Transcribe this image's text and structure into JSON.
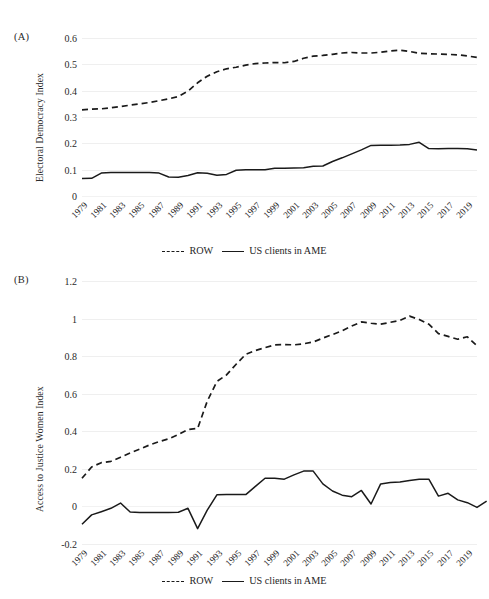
{
  "figure": {
    "panels": [
      {
        "id": "A",
        "label": "(A)",
        "ylabel": "Electoral Democracy Index"
      },
      {
        "id": "B",
        "label": "(B)",
        "ylabel": "Access to Justice Women Index"
      }
    ]
  },
  "legend": {
    "position": "bottom-center",
    "items": [
      {
        "label": "ROW",
        "style": "dashed"
      },
      {
        "label": "US clients in AME",
        "style": "solid"
      }
    ]
  },
  "chart_data": [
    {
      "type": "line",
      "panel": "A",
      "title": "",
      "xlabel": "",
      "ylabel": "Electoral Democracy Index",
      "ylim": [
        0,
        0.6
      ],
      "yticks": [
        0,
        0.1,
        0.2,
        0.3,
        0.4,
        0.5,
        0.6
      ],
      "ytick_labels": [
        "0",
        "0.1",
        "0.2",
        "0.3",
        "0.4",
        "0.5",
        "0.6"
      ],
      "grid": true,
      "x": [
        1979,
        1980,
        1981,
        1982,
        1983,
        1984,
        1985,
        1986,
        1987,
        1988,
        1989,
        1990,
        1991,
        1992,
        1993,
        1994,
        1995,
        1996,
        1997,
        1998,
        1999,
        2000,
        2001,
        2002,
        2003,
        2004,
        2005,
        2006,
        2007,
        2008,
        2009,
        2010,
        2011,
        2012,
        2013,
        2014,
        2015,
        2016,
        2017,
        2018,
        2019,
        2020
      ],
      "xtick_labels": [
        "1979",
        "1981",
        "1983",
        "1985",
        "1987",
        "1989",
        "1991",
        "1993",
        "1995",
        "1997",
        "1999",
        "2001",
        "2003",
        "2005",
        "2007",
        "2009",
        "2011",
        "2013",
        "2015",
        "2017",
        "2019"
      ],
      "series": [
        {
          "name": "ROW",
          "style": "dashed",
          "values": [
            0.327,
            0.33,
            0.331,
            0.335,
            0.34,
            0.345,
            0.35,
            0.355,
            0.362,
            0.369,
            0.378,
            0.398,
            0.43,
            0.455,
            0.472,
            0.483,
            0.489,
            0.497,
            0.503,
            0.505,
            0.507,
            0.506,
            0.511,
            0.523,
            0.531,
            0.534,
            0.538,
            0.543,
            0.545,
            0.543,
            0.543,
            0.546,
            0.551,
            0.554,
            0.549,
            0.542,
            0.54,
            0.539,
            0.538,
            0.536,
            0.532,
            0.526
          ]
        },
        {
          "name": "US clients in AME",
          "style": "solid",
          "values": [
            0.066,
            0.067,
            0.087,
            0.089,
            0.089,
            0.089,
            0.089,
            0.089,
            0.087,
            0.072,
            0.071,
            0.078,
            0.088,
            0.086,
            0.079,
            0.082,
            0.098,
            0.1,
            0.1,
            0.1,
            0.105,
            0.105,
            0.106,
            0.107,
            0.113,
            0.114,
            0.131,
            0.145,
            0.16,
            0.175,
            0.192,
            0.193,
            0.193,
            0.194,
            0.196,
            0.204,
            0.18,
            0.179,
            0.18,
            0.18,
            0.179,
            0.175
          ]
        }
      ]
    },
    {
      "type": "line",
      "panel": "B",
      "title": "",
      "xlabel": "",
      "ylabel": "Access to Justice Women Index",
      "ylim": [
        -0.2,
        1.2
      ],
      "yticks": [
        -0.2,
        0,
        0.2,
        0.4,
        0.6,
        0.8,
        1,
        1.2
      ],
      "ytick_labels": [
        "-0.2",
        "0",
        "0.2",
        "0.4",
        "0.6",
        "0.8",
        "1",
        "1.2"
      ],
      "grid": true,
      "x": [
        1979,
        1980,
        1981,
        1982,
        1983,
        1984,
        1985,
        1986,
        1987,
        1988,
        1989,
        1990,
        1991,
        1992,
        1993,
        1994,
        1995,
        1996,
        1997,
        1998,
        1999,
        2000,
        2001,
        2002,
        2003,
        2004,
        2005,
        2006,
        2007,
        2008,
        2009,
        2010,
        2011,
        2012,
        2013,
        2014,
        2015,
        2016,
        2017,
        2018,
        2019,
        2020
      ],
      "xtick_labels": [
        "1979",
        "1981",
        "1983",
        "1985",
        "1987",
        "1989",
        "1991",
        "1993",
        "1995",
        "1997",
        "1999",
        "2001",
        "2003",
        "2005",
        "2007",
        "2009",
        "2011",
        "2013",
        "2015",
        "2017",
        "2019"
      ],
      "series": [
        {
          "name": "ROW",
          "style": "dashed",
          "values": [
            0.15,
            0.21,
            0.233,
            0.24,
            0.262,
            0.285,
            0.305,
            0.327,
            0.345,
            0.36,
            0.383,
            0.41,
            0.415,
            0.56,
            0.665,
            0.7,
            0.757,
            0.81,
            0.83,
            0.845,
            0.86,
            0.862,
            0.86,
            0.866,
            0.875,
            0.896,
            0.915,
            0.935,
            0.96,
            0.982,
            0.975,
            0.97,
            0.98,
            0.99,
            1.013,
            0.995,
            0.97,
            0.92,
            0.905,
            0.89,
            0.903,
            0.855
          ]
        },
        {
          "name": "US clients in AME",
          "style": "solid",
          "values": [
            -0.095,
            -0.045,
            -0.028,
            -0.01,
            0.018,
            -0.03,
            -0.032,
            -0.032,
            -0.032,
            -0.032,
            -0.031,
            -0.01,
            -0.118,
            -0.02,
            0.062,
            0.063,
            0.063,
            0.063,
            0.107,
            0.15,
            0.15,
            0.145,
            0.168,
            0.188,
            0.188,
            0.12,
            0.082,
            0.06,
            0.052,
            0.085,
            0.013,
            0.12,
            0.127,
            0.13,
            0.138,
            0.145,
            0.145,
            0.055,
            0.07,
            0.035,
            0.02,
            -0.005,
            0.028
          ]
        }
      ]
    }
  ]
}
